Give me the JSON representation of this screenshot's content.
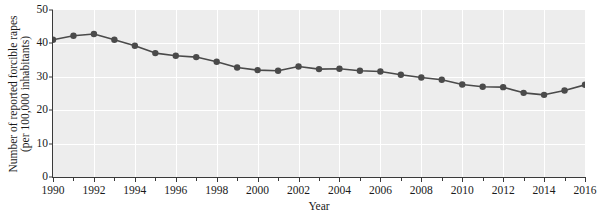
{
  "chart_data": {
    "type": "line",
    "title": "",
    "xlabel": "Year",
    "ylabel_lines": [
      "Number of reported forcible rapes",
      "(per 100,000 inhabitants)"
    ],
    "ylabel": "Number of reported forcible rapes (per 100,000 inhabitants)",
    "x": [
      1990,
      1991,
      1992,
      1993,
      1994,
      1995,
      1996,
      1997,
      1998,
      1999,
      2000,
      2001,
      2002,
      2003,
      2004,
      2005,
      2006,
      2007,
      2008,
      2009,
      2010,
      2011,
      2012,
      2013,
      2014,
      2015,
      2016
    ],
    "values": [
      41.1,
      42.3,
      42.8,
      41.1,
      39.3,
      37.1,
      36.3,
      35.9,
      34.5,
      32.8,
      32.0,
      31.8,
      33.1,
      32.3,
      32.4,
      31.8,
      31.6,
      30.6,
      29.8,
      29.1,
      27.7,
      27.0,
      26.9,
      25.2,
      24.6,
      25.9,
      27.6
    ],
    "xlim": [
      1990,
      2016
    ],
    "ylim": [
      0,
      50
    ],
    "y_ticks": [
      0,
      10,
      20,
      30,
      40,
      50
    ],
    "y_tick_labels": [
      "0",
      "10",
      "20",
      "30",
      "40",
      "50"
    ],
    "x_ticks": [
      1990,
      1992,
      1994,
      1996,
      1998,
      2000,
      2002,
      2004,
      2006,
      2008,
      2010,
      2012,
      2014,
      2016
    ],
    "x_tick_labels": [
      "1990",
      "1992",
      "1994",
      "1996",
      "1998",
      "2000",
      "2002",
      "2004",
      "2006",
      "2008",
      "2010",
      "2012",
      "2014",
      "2016"
    ],
    "x_minor_ticks": [
      1991,
      1993,
      1995,
      1997,
      1999,
      2001,
      2003,
      2005,
      2007,
      2009,
      2011,
      2013,
      2015
    ],
    "grid": true,
    "grid_color": "#ffffff",
    "plot_background": "#ededed",
    "figure_background": "#ffffff",
    "series_color": "#4a4a4a",
    "marker": "circle",
    "marker_size": 3.2,
    "line_width": 1.6,
    "legend": null
  }
}
